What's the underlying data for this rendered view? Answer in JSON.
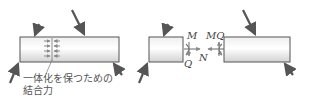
{
  "diagram": {
    "left_beam": {
      "caption_line1": "一体化を保つための",
      "caption_line2": "結合力"
    },
    "right_beams": {
      "labels": {
        "M_left": "M",
        "Q_left": "Q",
        "N": "N",
        "MQ_right": "MQ"
      }
    },
    "colors": {
      "beam_fill_top": "#f4f4f4",
      "beam_fill_mid": "#ffffff",
      "beam_fill_bottom": "#d8d8d8",
      "beam_stroke": "#555555",
      "arrow": "#555555",
      "internal_arrow": "#888888"
    }
  }
}
